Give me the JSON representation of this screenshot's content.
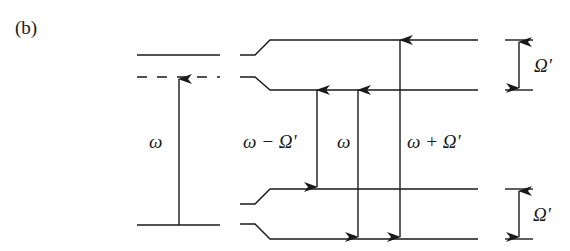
{
  "panel_label": "(b)",
  "left_scheme": {
    "excitation_label": "ω",
    "levels": [
      "upper-level",
      "virtual-level (dashed)",
      "ground-level"
    ]
  },
  "right_scheme": {
    "transitions": [
      {
        "label": "ω − Ω'",
        "direction": "down"
      },
      {
        "label": "ω",
        "direction": "down"
      },
      {
        "label": "ω + Ω'",
        "direction": "down"
      }
    ],
    "splittings": [
      {
        "label": "Ω'",
        "position": "upper"
      },
      {
        "label": "Ω'",
        "position": "lower"
      }
    ]
  },
  "labels": {
    "omega_left": "ω",
    "omega_minus": "ω − Ω'",
    "omega_mid": "ω",
    "omega_plus": "ω + Ω'",
    "omega_prime_top": "Ω'",
    "omega_prime_bottom": "Ω'"
  },
  "colors": {
    "ink": "#1a1a1a",
    "background": "#ffffff"
  }
}
